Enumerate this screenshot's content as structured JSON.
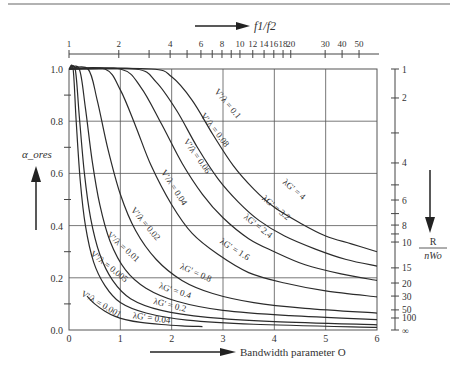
{
  "chart_data": {
    "type": "line",
    "title": "",
    "xlabel": "Bandwidth parameter O",
    "ylabel": "α_ores",
    "top_axis_label": "f1/f2",
    "right_axis_label_num": "R",
    "right_axis_label_den": "nWo",
    "xlim": [
      0,
      6
    ],
    "ylim": [
      0,
      1.0
    ],
    "grid": true,
    "x_ticks": [
      "0",
      "1",
      "2",
      "3",
      "4",
      "5",
      "6"
    ],
    "y_ticks": [
      "0.0",
      "0.2",
      "0.4",
      "0.6",
      "0.8",
      "1.0"
    ],
    "top_axis_ticks": [
      {
        "label": "1",
        "x": 0.0
      },
      {
        "label": "2",
        "x": 0.97
      },
      {
        "label": "",
        "x": 1.56
      },
      {
        "label": "4",
        "x": 1.97
      },
      {
        "label": "",
        "x": 2.3
      },
      {
        "label": "6",
        "x": 2.57
      },
      {
        "label": "",
        "x": 2.79
      },
      {
        "label": "8",
        "x": 2.98
      },
      {
        "label": "",
        "x": 3.16
      },
      {
        "label": "10",
        "x": 3.33
      },
      {
        "label": "12",
        "x": 3.58
      },
      {
        "label": "14",
        "x": 3.8
      },
      {
        "label": "16",
        "x": 3.99
      },
      {
        "label": "18",
        "x": 4.17
      },
      {
        "label": "20",
        "x": 4.32
      },
      {
        "label": "30",
        "x": 4.99
      },
      {
        "label": "40",
        "x": 5.32
      },
      {
        "label": "50",
        "x": 5.65
      }
    ],
    "right_axis_ticks": [
      {
        "label": "1",
        "y": 1.0
      },
      {
        "label": "2",
        "y": 0.889
      },
      {
        "label": "",
        "y": 0.755
      },
      {
        "label": "4",
        "y": 0.64
      },
      {
        "label": "",
        "y": 0.556
      },
      {
        "label": "6",
        "y": 0.498
      },
      {
        "label": "",
        "y": 0.446
      },
      {
        "label": "8",
        "y": 0.402
      },
      {
        "label": "",
        "y": 0.368
      },
      {
        "label": "10",
        "y": 0.337
      },
      {
        "label": "15",
        "y": 0.238
      },
      {
        "label": "20",
        "y": 0.18
      },
      {
        "label": "30",
        "y": 0.13
      },
      {
        "label": "50",
        "y": 0.077
      },
      {
        "label": "100",
        "y": 0.046
      },
      {
        "label": "∞",
        "y": 0.0
      }
    ],
    "series": [
      {
        "name": "V'/λ = 0.1 / λG' = 4",
        "v_label": "V'/λ = 0.1",
        "g_label": "λG' = 4",
        "x": [
          0,
          1.6,
          2.0,
          2.4,
          2.8,
          3.2,
          3.6,
          4.0,
          4.5,
          5.0,
          5.5,
          6.0
        ],
        "y": [
          1.0,
          1.0,
          0.97,
          0.88,
          0.75,
          0.63,
          0.54,
          0.47,
          0.41,
          0.36,
          0.33,
          0.3
        ]
      },
      {
        "name": "V'/λ = 0.08 / λG' = 3.2",
        "v_label": "V'/λ = 0.08",
        "g_label": "λG' = 3.2",
        "x": [
          0,
          1.3,
          1.7,
          2.1,
          2.5,
          2.9,
          3.3,
          3.7,
          4.2,
          4.8,
          5.4,
          6.0
        ],
        "y": [
          1.0,
          1.0,
          0.95,
          0.84,
          0.7,
          0.58,
          0.49,
          0.42,
          0.36,
          0.31,
          0.27,
          0.245
        ]
      },
      {
        "name": "V'/λ = 0.06 / λG' = 2.4",
        "v_label": "V'/λ = 0.06",
        "g_label": "λG' = 2.4",
        "x": [
          0,
          1.0,
          1.4,
          1.8,
          2.2,
          2.6,
          3.0,
          3.5,
          4.0,
          4.6,
          5.3,
          6.0
        ],
        "y": [
          1.0,
          1.0,
          0.93,
          0.79,
          0.64,
          0.52,
          0.43,
          0.35,
          0.3,
          0.25,
          0.215,
          0.19
        ]
      },
      {
        "name": "V'/λ = 0.04 / λG' = 1.6",
        "v_label": "V'/λ = 0.04",
        "g_label": "λG' = 1.6",
        "x": [
          0,
          0.7,
          1.0,
          1.3,
          1.6,
          2.0,
          2.4,
          2.9,
          3.5,
          4.2,
          5.0,
          6.0
        ],
        "y": [
          1.0,
          1.0,
          0.92,
          0.78,
          0.63,
          0.48,
          0.37,
          0.29,
          0.22,
          0.18,
          0.15,
          0.127
        ]
      },
      {
        "name": "V'/λ = 0.02 / λG' = 0.8",
        "v_label": "V'/λ = 0.02",
        "g_label": "λG' = 0.8",
        "x": [
          0,
          0.37,
          0.55,
          0.75,
          1.0,
          1.3,
          1.7,
          2.2,
          2.8,
          3.6,
          4.6,
          6.0
        ],
        "y": [
          1.0,
          1.0,
          0.88,
          0.7,
          0.52,
          0.38,
          0.27,
          0.19,
          0.14,
          0.105,
          0.083,
          0.065
        ]
      },
      {
        "name": "V'/λ = 0.01 / λG' = 0.4",
        "v_label": "V'/λ = 0.01",
        "g_label": "λG' = 0.4",
        "x": [
          0,
          0.2,
          0.32,
          0.45,
          0.6,
          0.8,
          1.1,
          1.5,
          2.1,
          3.0,
          4.3,
          6.0
        ],
        "y": [
          1.0,
          1.0,
          0.85,
          0.65,
          0.48,
          0.34,
          0.23,
          0.16,
          0.11,
          0.075,
          0.055,
          0.04
        ]
      },
      {
        "name": "V'/λ = 0.005 / λG' = 0.2",
        "v_label": "V'/λ = 0.005",
        "g_label": "λG' = 0.2",
        "x": [
          0,
          0.12,
          0.2,
          0.3,
          0.42,
          0.6,
          0.85,
          1.2,
          1.8,
          2.7,
          4.0,
          6.0
        ],
        "y": [
          1.0,
          1.0,
          0.82,
          0.6,
          0.43,
          0.29,
          0.19,
          0.12,
          0.075,
          0.048,
          0.032,
          0.02
        ]
      },
      {
        "name": "V'/λ = 0.001 / λG' = 0.04",
        "v_label": "V'/λ = 0.001",
        "g_label": "λG' = 0.04",
        "x": [
          0.35,
          0.5,
          0.7,
          0.9,
          1.1,
          1.4,
          1.8,
          2.2,
          2.6
        ],
        "y": [
          0.13,
          0.1,
          0.072,
          0.052,
          0.04,
          0.029,
          0.021,
          0.016,
          0.013
        ]
      }
    ],
    "series_extra": [
      {
        "name": "unlabeled curve (λG' ≈ 0.1)",
        "x": [
          0,
          0.08,
          0.14,
          0.22,
          0.32,
          0.48,
          0.7,
          1.0,
          1.5,
          2.3,
          3.6,
          6.0
        ],
        "y": [
          1.0,
          1.0,
          0.8,
          0.57,
          0.4,
          0.26,
          0.17,
          0.105,
          0.065,
          0.038,
          0.022,
          0.01
        ]
      }
    ],
    "curve_labels": [
      {
        "text": "V'/λ = 0.1",
        "x": 3.05,
        "y": 0.86,
        "angle": 50
      },
      {
        "text": "V'/λ = 0.08",
        "x": 2.8,
        "y": 0.76,
        "angle": 52
      },
      {
        "text": "V'/λ = 0.06",
        "x": 2.45,
        "y": 0.66,
        "angle": 55
      },
      {
        "text": "V'/λ = 0.04",
        "x": 2.0,
        "y": 0.54,
        "angle": 57
      },
      {
        "text": "V'/λ = 0.02",
        "x": 1.45,
        "y": 0.4,
        "angle": 50
      },
      {
        "text": "V'/λ = 0.01",
        "x": 1.02,
        "y": 0.31,
        "angle": 42
      },
      {
        "text": "V'/λ = 0.005",
        "x": 0.75,
        "y": 0.235,
        "angle": 38
      },
      {
        "text": "V'/λ = 0.001",
        "x": 0.6,
        "y": 0.09,
        "angle": 30
      },
      {
        "text": "λG' = 4",
        "x": 4.35,
        "y": 0.53,
        "angle": 40
      },
      {
        "text": "λG' = 3.2",
        "x": 4.0,
        "y": 0.46,
        "angle": 40
      },
      {
        "text": "λG' = 2.4",
        "x": 3.65,
        "y": 0.39,
        "angle": 38
      },
      {
        "text": "λG' = 1.6",
        "x": 3.2,
        "y": 0.3,
        "angle": 32
      },
      {
        "text": "λG' = 0.8",
        "x": 2.45,
        "y": 0.21,
        "angle": 24
      },
      {
        "text": "λG' = 0.4",
        "x": 2.05,
        "y": 0.14,
        "angle": 18
      },
      {
        "text": "λG' = 0.2",
        "x": 1.95,
        "y": 0.085,
        "angle": 14
      },
      {
        "text": "λG' = 0.04",
        "x": 1.6,
        "y": 0.035,
        "angle": 8
      }
    ]
  },
  "colors": {
    "line": "#2b2b2b",
    "grid": "#555555",
    "text": "#333333",
    "rule": "#666666"
  }
}
